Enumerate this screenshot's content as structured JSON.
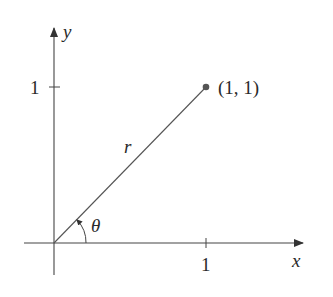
{
  "diagram": {
    "axes": {
      "x_label": "x",
      "y_label": "y"
    },
    "ticks": {
      "x_tick": "1",
      "y_tick": "1"
    },
    "point": {
      "label": "(1, 1)",
      "x": 1,
      "y": 1
    },
    "segment": {
      "label": "r"
    },
    "angle": {
      "label": "θ"
    },
    "colors": {
      "line": "#333333",
      "point": "#555555"
    }
  }
}
